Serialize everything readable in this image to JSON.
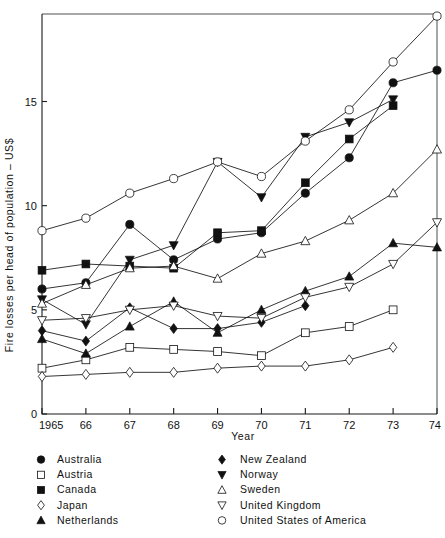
{
  "chart_data": {
    "type": "line",
    "title": "",
    "xlabel": "Year",
    "ylabel": "Fire losses per head of population – US$",
    "x": [
      1965,
      1966,
      1967,
      1968,
      1969,
      1970,
      1971,
      1972,
      1973,
      1974
    ],
    "xtick_labels": [
      "1965",
      "66",
      "67",
      "68",
      "69",
      "70",
      "71",
      "72",
      "73",
      "74"
    ],
    "ytick_labels": [
      "0",
      "5",
      "10",
      "15"
    ],
    "ytick_values": [
      0,
      5,
      10,
      15
    ],
    "xlim": [
      1965,
      1974
    ],
    "ylim": [
      0,
      19.2
    ],
    "grid": false,
    "legend_position": "below-plot",
    "series": [
      {
        "name": "Australia",
        "marker": "filled-circle",
        "values": [
          6.0,
          6.3,
          9.1,
          7.4,
          8.4,
          8.7,
          10.6,
          12.3,
          15.9,
          16.5
        ]
      },
      {
        "name": "Austria",
        "marker": "open-square",
        "values": [
          2.2,
          2.6,
          3.2,
          3.1,
          3.0,
          2.8,
          3.9,
          4.2,
          5.0,
          null
        ]
      },
      {
        "name": "Canada",
        "marker": "filled-square",
        "values": [
          6.9,
          7.2,
          7.1,
          7.0,
          8.7,
          8.8,
          11.1,
          13.2,
          14.8,
          null
        ]
      },
      {
        "name": "Japan",
        "marker": "open-diamond",
        "values": [
          1.8,
          1.9,
          2.0,
          2.0,
          2.2,
          2.3,
          2.3,
          2.6,
          3.2,
          null
        ]
      },
      {
        "name": "Netherlands",
        "marker": "filled-triangle",
        "values": [
          3.6,
          2.9,
          4.2,
          5.4,
          3.9,
          5.0,
          5.9,
          6.6,
          8.2,
          8.0
        ]
      },
      {
        "name": "New Zealand",
        "marker": "filled-diamond",
        "values": [
          4.0,
          3.5,
          5.1,
          4.1,
          4.1,
          4.4,
          5.2,
          null,
          null,
          null
        ]
      },
      {
        "name": "Norway",
        "marker": "filled-triangle-down",
        "values": [
          5.5,
          4.3,
          7.4,
          8.1,
          12.1,
          10.4,
          13.3,
          14.0,
          15.1,
          null
        ]
      },
      {
        "name": "Sweden",
        "marker": "open-triangle",
        "values": [
          5.3,
          6.2,
          7.0,
          7.1,
          6.5,
          7.7,
          8.3,
          9.3,
          10.6,
          12.7
        ]
      },
      {
        "name": "United Kingdom",
        "marker": "open-triangle-down",
        "values": [
          4.5,
          4.6,
          5.0,
          5.2,
          4.7,
          4.6,
          5.6,
          6.1,
          7.2,
          9.2
        ]
      },
      {
        "name": "United States of America",
        "marker": "open-circle",
        "values": [
          8.8,
          9.4,
          10.6,
          11.3,
          12.1,
          11.4,
          13.1,
          14.6,
          16.9,
          19.1
        ]
      }
    ]
  },
  "legend": {
    "column_left": [
      {
        "label": "Australia",
        "marker": "filled-circle"
      },
      {
        "label": "Austria",
        "marker": "open-square"
      },
      {
        "label": "Canada",
        "marker": "filled-square"
      },
      {
        "label": "Japan",
        "marker": "open-diamond"
      },
      {
        "label": "Netherlands",
        "marker": "filled-triangle"
      }
    ],
    "column_right": [
      {
        "label": "New Zealand",
        "marker": "filled-diamond"
      },
      {
        "label": "Norway",
        "marker": "filled-triangle-down"
      },
      {
        "label": "Sweden",
        "marker": "open-triangle"
      },
      {
        "label": "United Kingdom",
        "marker": "open-triangle-down"
      },
      {
        "label": "United States of America",
        "marker": "open-circle"
      }
    ]
  },
  "colors": {
    "ink": "#111111",
    "background": "#ffffff",
    "frame": "#3a3a3a"
  }
}
